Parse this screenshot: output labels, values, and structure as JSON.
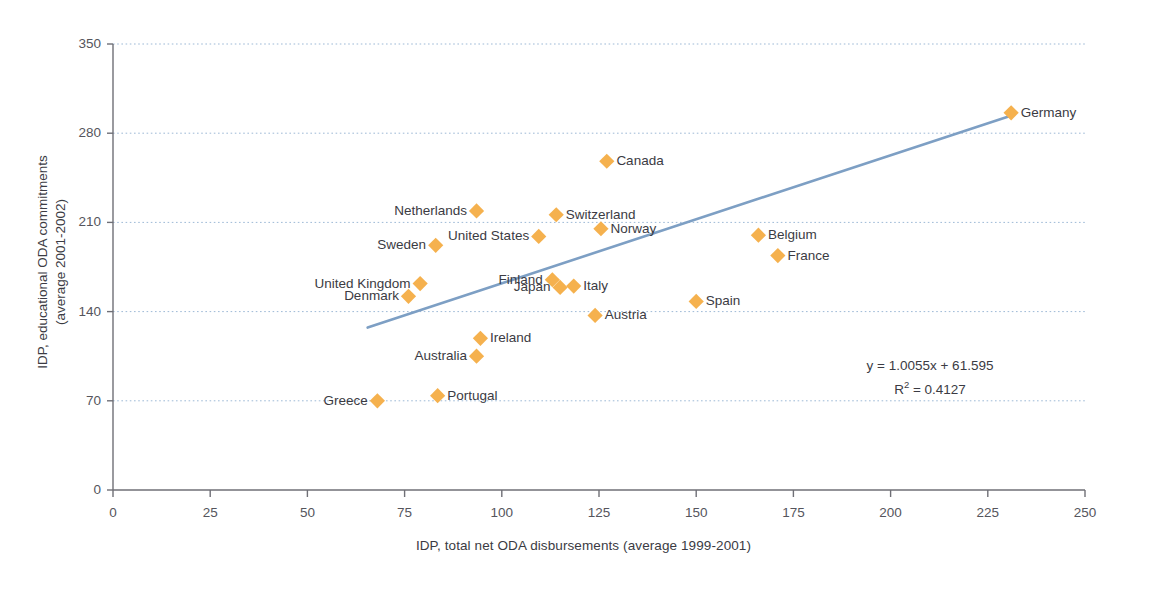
{
  "chart_data": {
    "type": "scatter",
    "title": "",
    "xlabel": "IDP, total net ODA disbursements (average 1999-2001)",
    "ylabel_line1": "IDP, educational ODA commitments",
    "ylabel_line2": "(average 2001-2002)",
    "xlim": [
      0,
      250
    ],
    "ylim": [
      0,
      350
    ],
    "xticks": [
      0,
      25,
      50,
      75,
      100,
      125,
      150,
      175,
      200,
      225,
      250
    ],
    "yticks": [
      0,
      70,
      140,
      210,
      280,
      350
    ],
    "grid": "horizontal-dotted",
    "legend": "none",
    "marker_shape": "diamond",
    "marker_color": "#f5b14e",
    "trendline": {
      "equation": "y = 1.0055x + 61.595",
      "r_squared": "R² = 0.4127",
      "slope": 1.0055,
      "intercept": 61.595,
      "color": "#7d9fc4",
      "x_start": 65.5,
      "x_end": 231.5
    },
    "points": [
      {
        "name": "Germany",
        "x": 231.0,
        "y": 296.0,
        "label_side": "right"
      },
      {
        "name": "Canada",
        "x": 127.0,
        "y": 258.0,
        "label_side": "right"
      },
      {
        "name": "Switzerland",
        "x": 114.0,
        "y": 216.0,
        "label_side": "right"
      },
      {
        "name": "Netherlands",
        "x": 93.5,
        "y": 219.0,
        "label_side": "left"
      },
      {
        "name": "Norway",
        "x": 125.5,
        "y": 205.0,
        "label_side": "right"
      },
      {
        "name": "Belgium",
        "x": 166.0,
        "y": 200.0,
        "label_side": "right"
      },
      {
        "name": "United States",
        "x": 109.5,
        "y": 199.0,
        "label_side": "left"
      },
      {
        "name": "Sweden",
        "x": 83.0,
        "y": 192.0,
        "label_side": "left"
      },
      {
        "name": "France",
        "x": 171.0,
        "y": 184.0,
        "label_side": "right"
      },
      {
        "name": "United Kingdom",
        "x": 79.0,
        "y": 162.0,
        "label_side": "left"
      },
      {
        "name": "Finland",
        "x": 113.0,
        "y": 165.0,
        "label_side": "left"
      },
      {
        "name": "Italy",
        "x": 118.5,
        "y": 160.0,
        "label_side": "right"
      },
      {
        "name": "Japan",
        "x": 115.0,
        "y": 159.0,
        "label_side": "left"
      },
      {
        "name": "Denmark",
        "x": 76.0,
        "y": 152.0,
        "label_side": "left"
      },
      {
        "name": "Spain",
        "x": 150.0,
        "y": 148.0,
        "label_side": "right"
      },
      {
        "name": "Austria",
        "x": 124.0,
        "y": 137.0,
        "label_side": "right"
      },
      {
        "name": "Ireland",
        "x": 94.5,
        "y": 119.0,
        "label_side": "right"
      },
      {
        "name": "Australia",
        "x": 93.5,
        "y": 105.0,
        "label_side": "left"
      },
      {
        "name": "Portugal",
        "x": 83.5,
        "y": 74.0,
        "label_side": "right"
      },
      {
        "name": "Greece",
        "x": 68.0,
        "y": 70.0,
        "label_side": "left"
      }
    ]
  }
}
